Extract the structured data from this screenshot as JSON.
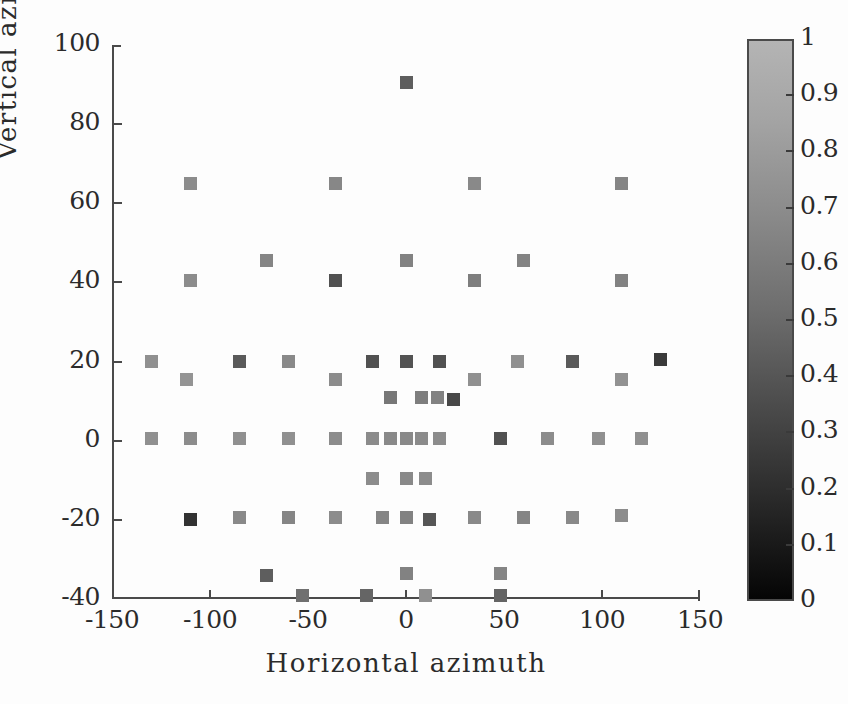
{
  "chart_data": {
    "type": "scatter",
    "title": "",
    "xlabel": "Horizontal azimuth",
    "ylabel": "Vertical azimuth",
    "xlim": [
      -150,
      150
    ],
    "ylim": [
      -40,
      100
    ],
    "xticks": [
      -150,
      -100,
      -50,
      0,
      50,
      100,
      150
    ],
    "yticks": [
      -40,
      -20,
      0,
      20,
      40,
      60,
      80,
      100
    ],
    "xticklabels": [
      "-150",
      "-100",
      "-50",
      "0",
      "50",
      "100",
      "150"
    ],
    "yticklabels": [
      "-40",
      "-20",
      "0",
      "20",
      "40",
      "60",
      "80",
      "100"
    ],
    "grid": false,
    "legend": null,
    "marker": "square",
    "colormap": "gray",
    "colorbar": {
      "vmin": 0,
      "vmax": 1,
      "ticks": [
        0,
        0.1,
        0.2,
        0.3,
        0.4,
        0.5,
        0.6,
        0.7,
        0.8,
        0.9,
        1
      ],
      "ticklabels": [
        "0",
        "0.1",
        "0.2",
        "0.3",
        "0.4",
        "0.5",
        "0.6",
        "0.7",
        "0.8",
        "0.9",
        "1"
      ],
      "position": "right",
      "low_color": "#000000",
      "high_color": "#b4b4b4"
    },
    "points": [
      {
        "x": 0,
        "y": 90.5,
        "c": 0.52
      },
      {
        "x": -110,
        "y": 65,
        "c": 0.78
      },
      {
        "x": -36,
        "y": 65,
        "c": 0.75
      },
      {
        "x": 35,
        "y": 65,
        "c": 0.76
      },
      {
        "x": 110,
        "y": 65,
        "c": 0.74
      },
      {
        "x": -71,
        "y": 45.5,
        "c": 0.74
      },
      {
        "x": 0,
        "y": 45.5,
        "c": 0.72
      },
      {
        "x": 60,
        "y": 45.5,
        "c": 0.73
      },
      {
        "x": -110,
        "y": 40.5,
        "c": 0.78
      },
      {
        "x": -36,
        "y": 40.5,
        "c": 0.45
      },
      {
        "x": 35,
        "y": 40.5,
        "c": 0.7
      },
      {
        "x": 110,
        "y": 40.5,
        "c": 0.72
      },
      {
        "x": -130,
        "y": 20,
        "c": 0.8
      },
      {
        "x": -85,
        "y": 20,
        "c": 0.5
      },
      {
        "x": -60,
        "y": 20,
        "c": 0.76
      },
      {
        "x": -17,
        "y": 20,
        "c": 0.45
      },
      {
        "x": 0,
        "y": 20,
        "c": 0.46
      },
      {
        "x": 17,
        "y": 20,
        "c": 0.45
      },
      {
        "x": 57,
        "y": 20,
        "c": 0.8
      },
      {
        "x": 85,
        "y": 20,
        "c": 0.5
      },
      {
        "x": 130,
        "y": 20.5,
        "c": 0.32
      },
      {
        "x": -112,
        "y": 15.5,
        "c": 0.82
      },
      {
        "x": -36,
        "y": 15.5,
        "c": 0.78
      },
      {
        "x": 35,
        "y": 15.5,
        "c": 0.8
      },
      {
        "x": 110,
        "y": 15.5,
        "c": 0.81
      },
      {
        "x": -8,
        "y": 11,
        "c": 0.66
      },
      {
        "x": 8,
        "y": 11,
        "c": 0.7
      },
      {
        "x": 16,
        "y": 11,
        "c": 0.72
      },
      {
        "x": 24,
        "y": 10.5,
        "c": 0.4
      },
      {
        "x": -130,
        "y": 0.5,
        "c": 0.8
      },
      {
        "x": -110,
        "y": 0.5,
        "c": 0.78
      },
      {
        "x": -85,
        "y": 0.5,
        "c": 0.8
      },
      {
        "x": -60,
        "y": 0.5,
        "c": 0.8
      },
      {
        "x": -36,
        "y": 0.5,
        "c": 0.78
      },
      {
        "x": -17,
        "y": 0.5,
        "c": 0.77
      },
      {
        "x": -8,
        "y": 0.5,
        "c": 0.76
      },
      {
        "x": 0,
        "y": 0.5,
        "c": 0.76
      },
      {
        "x": 8,
        "y": 0.5,
        "c": 0.77
      },
      {
        "x": 17,
        "y": 0.5,
        "c": 0.78
      },
      {
        "x": 48,
        "y": 0.5,
        "c": 0.45
      },
      {
        "x": 72,
        "y": 0.5,
        "c": 0.78
      },
      {
        "x": 98,
        "y": 0.5,
        "c": 0.8
      },
      {
        "x": 120,
        "y": 0.5,
        "c": 0.8
      },
      {
        "x": -17,
        "y": -9.5,
        "c": 0.78
      },
      {
        "x": 0,
        "y": -9.5,
        "c": 0.76
      },
      {
        "x": 10,
        "y": -9.5,
        "c": 0.78
      },
      {
        "x": -110,
        "y": -20,
        "c": 0.28
      },
      {
        "x": -85,
        "y": -19.5,
        "c": 0.76
      },
      {
        "x": -60,
        "y": -19.5,
        "c": 0.74
      },
      {
        "x": -36,
        "y": -19.5,
        "c": 0.78
      },
      {
        "x": -12,
        "y": -19.5,
        "c": 0.74
      },
      {
        "x": 0,
        "y": -19.5,
        "c": 0.72
      },
      {
        "x": 12,
        "y": -20,
        "c": 0.48
      },
      {
        "x": 35,
        "y": -19.5,
        "c": 0.76
      },
      {
        "x": 60,
        "y": -19.5,
        "c": 0.74
      },
      {
        "x": 85,
        "y": -19.5,
        "c": 0.76
      },
      {
        "x": 110,
        "y": -19,
        "c": 0.78
      },
      {
        "x": -71,
        "y": -34,
        "c": 0.52
      },
      {
        "x": 0,
        "y": -33.5,
        "c": 0.72
      },
      {
        "x": 48,
        "y": -33.5,
        "c": 0.74
      },
      {
        "x": -53,
        "y": -39,
        "c": 0.62
      },
      {
        "x": -20,
        "y": -39,
        "c": 0.56
      },
      {
        "x": 10,
        "y": -39,
        "c": 0.8
      },
      {
        "x": 48,
        "y": -39,
        "c": 0.56
      }
    ]
  }
}
